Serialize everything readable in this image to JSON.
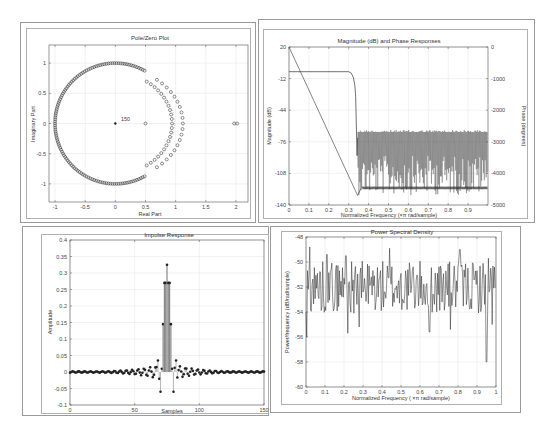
{
  "chart_data": [
    {
      "id": "pole-zero",
      "type": "scatter",
      "title": "Pole/Zero Plot",
      "xlabel": "Real Part",
      "ylabel": "Imaginary Part",
      "xlim": [
        -1.1,
        2.2
      ],
      "ylim": [
        -1.3,
        1.3
      ],
      "xticks": [
        "-1",
        "-0.5",
        "0",
        "0.5",
        "1",
        "1.5",
        "2"
      ],
      "yticks": [
        "1",
        "0.5",
        "0",
        "-0.5",
        "-1"
      ],
      "annotations": [
        {
          "text": "150",
          "x": 0.03,
          "y": 0.03
        }
      ],
      "series": [
        {
          "name": "zeros-unit-circle",
          "marker": "o",
          "description": "zeros on unit circle from angle ~61° to ~299° (stopband)"
        },
        {
          "name": "zeros-inner-arc",
          "marker": "o",
          "description": "zeros arc radius ~0.88-1.0 near passband edge"
        },
        {
          "name": "zeros-outer-arc",
          "marker": "o",
          "description": "zeros arc radius ~1.12 near passband edge"
        },
        {
          "name": "zeros-real",
          "marker": "o",
          "points": [
            [
              0.5,
              0
            ],
            [
              1.97,
              0
            ],
            [
              2.02,
              0
            ]
          ]
        },
        {
          "name": "poles",
          "marker": "x",
          "points": [
            [
              0,
              0
            ]
          ],
          "multiplicity": 150
        }
      ],
      "grid": true
    },
    {
      "id": "magnitude-phase",
      "type": "line",
      "title": "Magnitude (dB) and Phase Responses",
      "xlabel": "Normalized Frequency (×π rad/sample)",
      "ylabel": "Magnitude (dB)",
      "ylabel_right": "Phase (degrees)",
      "xlim": [
        0,
        1
      ],
      "ylim": [
        -140,
        20
      ],
      "ylim_right": [
        -5000,
        0
      ],
      "xticks": [
        "0",
        "0.1",
        "0.2",
        "0.3",
        "0.4",
        "0.5",
        "0.6",
        "0.7",
        "0.8",
        "0.9"
      ],
      "yticks": [
        "20",
        "-12",
        "-44",
        "-76",
        "-108",
        "-140"
      ],
      "yticks_right": [
        "0",
        "-1000",
        "-2000",
        "-3000",
        "-4000",
        "-5000"
      ],
      "series": [
        {
          "name": "Magnitude",
          "x": [
            0,
            0.3,
            0.32,
            0.335,
            0.345,
            0.35,
            1.0
          ],
          "y": [
            -5,
            -5,
            -12,
            -60,
            -110,
            -65,
            -65
          ],
          "note": "stopband ripple between approx -65 and -140 dB"
        },
        {
          "name": "Phase",
          "x": [
            0,
            0.345,
            0.36,
            0.4,
            1.0
          ],
          "y": [
            0,
            -4700,
            -4500,
            -4450,
            -4450
          ],
          "note": "linear phase then wraps near -4400 deg"
        }
      ],
      "grid": true
    },
    {
      "id": "impulse-response",
      "type": "bar",
      "subtype": "stem",
      "title": "Impulse Response",
      "xlabel": "Samples",
      "ylabel": "Amplitude",
      "xlim": [
        0,
        150
      ],
      "ylim": [
        -0.1,
        0.4
      ],
      "xticks": [
        "0",
        "50",
        "100",
        "150"
      ],
      "yticks": [
        "0.4",
        "0.35",
        "0.3",
        "0.25",
        "0.2",
        "0.15",
        "0.1",
        "0.05",
        "0",
        "-0.05",
        "-0.1"
      ],
      "peak": {
        "x": 75,
        "y": 0.325
      },
      "key_points": [
        [
          73,
          0.27
        ],
        [
          74,
          0.27
        ],
        [
          76,
          0.27
        ],
        [
          77,
          0.27
        ],
        [
          72,
          0.145
        ],
        [
          78,
          0.145
        ],
        [
          70,
          -0.06
        ],
        [
          80,
          -0.06
        ],
        [
          68,
          0.035
        ],
        [
          82,
          0.035
        ],
        [
          71,
          0.01
        ],
        [
          79,
          0.01
        ]
      ],
      "grid": true
    },
    {
      "id": "psd",
      "type": "line",
      "title": "Power Spectral Density",
      "xlabel": "Normalized Frequency (×π rad/sample)",
      "ylabel": "Power/frequency (dB/rad/sample)",
      "xlim": [
        0,
        1
      ],
      "ylim": [
        -60,
        -48
      ],
      "xticks": [
        "0",
        "0.1",
        "0.2",
        "0.3",
        "0.4",
        "0.5",
        "0.6",
        "0.7",
        "0.8",
        "0.9",
        "1"
      ],
      "yticks": [
        "-48",
        "-50",
        "-52",
        "-54",
        "-56",
        "-58",
        "-60"
      ],
      "note": "noisy trace fluctuating roughly between -49 and -56 dB, minima near -58 at 0.95",
      "grid": true
    }
  ],
  "labels": {
    "pz_title": "Pole/Zero Plot",
    "pz_xlabel": "Real Part",
    "pz_ylabel": "Imaginary Part",
    "pz_annot": "150",
    "mag_title": "Magnitude (dB) and Phase Responses",
    "mag_xlabel": "Normalized Frequency (×π rad/sample)",
    "mag_ylabel": "Magnitude (dB)",
    "mag_ylabel_r": "Phase (degrees)",
    "imp_title": "Impulse Response",
    "imp_xlabel": "Samples",
    "imp_ylabel": "Amplitude",
    "psd_title": "Power Spectral Density",
    "psd_xlabel": "Normalized Frequency ( ×π rad/sample)",
    "psd_ylabel": "Power/frequency (dB/rad/sample)"
  }
}
